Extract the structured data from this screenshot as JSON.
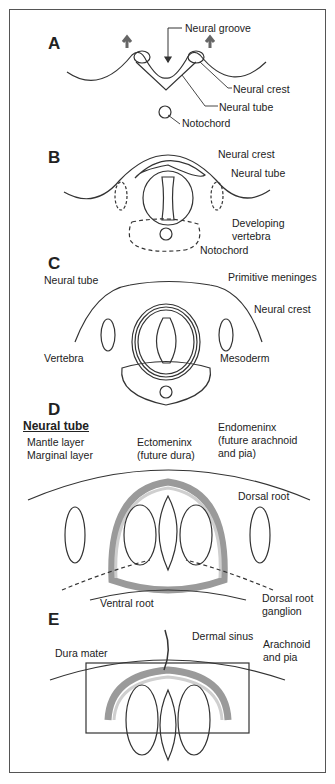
{
  "colors": {
    "line": "#333333",
    "meninx_dark": "#9a9a9a",
    "meninx_light": "#cfcfcf",
    "arrow": "#666666"
  },
  "panels": [
    {
      "id": "A",
      "labels": [
        "Neural groove",
        "Neural crest",
        "Neural tube",
        "Notochord"
      ]
    },
    {
      "id": "B",
      "labels": [
        "Neural crest",
        "Neural tube",
        "Developing",
        "vertebra",
        "Notochord"
      ]
    },
    {
      "id": "C",
      "labels": [
        "Neural tube",
        "Primitive meninges",
        "Neural crest",
        "Vertebra",
        "Mesoderm"
      ]
    },
    {
      "id": "D",
      "heading": "Neural tube",
      "labels": [
        "Mantle layer",
        "Marginal layer",
        "Ectomeninx",
        "(future dura)",
        "Endomeninx",
        "(future arachnoid",
        "and pia)",
        "Dorsal root",
        "Ventral root",
        "Dorsal root",
        "ganglion"
      ]
    },
    {
      "id": "E",
      "labels": [
        "Dermal sinus",
        "Dura mater",
        "Arachnoid",
        "and pia"
      ]
    }
  ]
}
